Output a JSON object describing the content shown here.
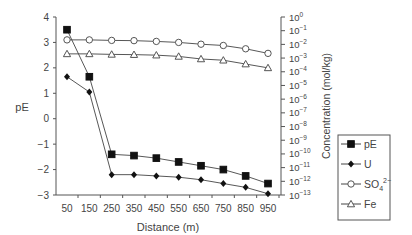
{
  "chart_data": {
    "type": "line",
    "title": "",
    "xlabel": "Distance (m)",
    "ylabel": "pE",
    "y2label": "Concentration (mol/kg)",
    "x": [
      50,
      150,
      250,
      350,
      450,
      550,
      650,
      750,
      850,
      950
    ],
    "x_tick_labels": [
      "50",
      "150",
      "250",
      "350",
      "450",
      "550",
      "650",
      "750",
      "850",
      "950"
    ],
    "ylim": [
      -3,
      4
    ],
    "y_ticks": [
      4,
      3,
      2,
      1,
      0,
      -1,
      -2,
      -3
    ],
    "y_tick_labels": [
      "4",
      "3",
      "2",
      "1",
      "0",
      "−1",
      "−2",
      "−3"
    ],
    "y2lim_log10": [
      -13,
      0
    ],
    "y2_tick_exponents": [
      0,
      -1,
      -2,
      -3,
      -4,
      -5,
      -6,
      -7,
      -8,
      -9,
      -10,
      -11,
      -12,
      -13
    ],
    "grid": false,
    "legend_position": "right",
    "series": [
      {
        "name": "pE",
        "axis": "left",
        "marker": "filled-square",
        "values": [
          3.5,
          1.65,
          -1.4,
          -1.45,
          -1.55,
          -1.7,
          -1.85,
          -2.0,
          -2.25,
          -2.55
        ]
      },
      {
        "name": "U",
        "axis": "right",
        "marker": "filled-diamond",
        "log10_values": [
          -4.0,
          -5.1,
          -11.1,
          -11.1,
          -11.2,
          -11.3,
          -11.5,
          -11.8,
          -12.1,
          -12.5
        ],
        "plot_pE_equiv": [
          1.65,
          1.05,
          -2.2,
          -2.2,
          -2.25,
          -2.3,
          -2.4,
          -2.55,
          -2.7,
          -2.95
        ]
      },
      {
        "name": "SO4 2−",
        "axis": "right",
        "marker": "open-circle",
        "log10_values": [
          -1.7,
          -1.7,
          -1.74,
          -1.76,
          -1.81,
          -1.89,
          -2.02,
          -2.11,
          -2.35,
          -2.68
        ],
        "plot_pE_equiv": [
          3.1,
          3.1,
          3.08,
          3.07,
          3.04,
          3.0,
          2.93,
          2.88,
          2.75,
          2.57
        ]
      },
      {
        "name": "Fe",
        "axis": "right",
        "marker": "open-triangle",
        "log10_values": [
          -2.74,
          -2.74,
          -2.78,
          -2.79,
          -2.83,
          -2.92,
          -3.11,
          -3.2,
          -3.48,
          -3.76
        ],
        "plot_pE_equiv": [
          2.55,
          2.55,
          2.53,
          2.52,
          2.5,
          2.45,
          2.35,
          2.3,
          2.15,
          2.0
        ]
      }
    ],
    "legend": [
      {
        "label": "pE",
        "marker": "filled-square"
      },
      {
        "label": "U",
        "marker": "filled-diamond"
      },
      {
        "label": "SO",
        "sub": "4",
        "sup": "2−",
        "marker": "open-circle"
      },
      {
        "label": "Fe",
        "marker": "open-triangle"
      }
    ]
  }
}
